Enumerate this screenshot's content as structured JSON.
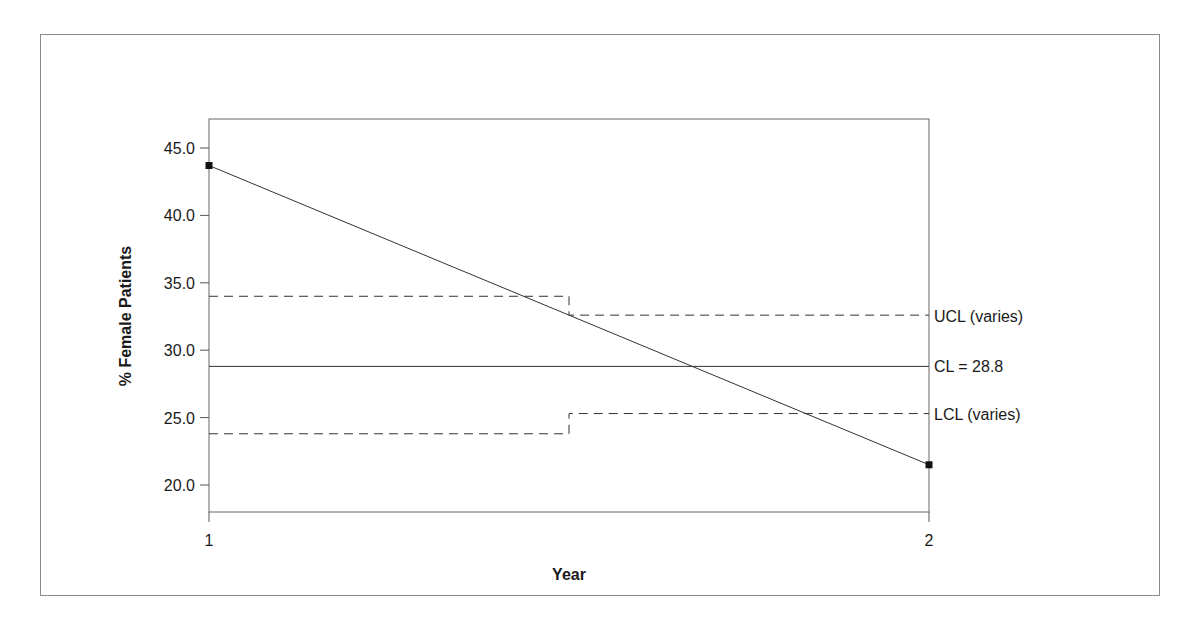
{
  "chart_data": {
    "type": "line",
    "subtype": "p-chart (control chart)",
    "title": "",
    "xlabel": "Year",
    "ylabel": "% Female Patients",
    "x": [
      1,
      2
    ],
    "x_tick_labels": [
      "1",
      "2"
    ],
    "y_ticks": [
      20.0,
      25.0,
      30.0,
      35.0,
      40.0,
      45.0
    ],
    "y_tick_labels": [
      "20.0",
      "25.0",
      "30.0",
      "35.0",
      "40.0",
      "45.0"
    ],
    "ylim": [
      18.0,
      47.2
    ],
    "xlim": [
      1,
      2
    ],
    "grid": false,
    "series": [
      {
        "name": "% Female Patients",
        "values": [
          43.7,
          21.5
        ],
        "marker": "square",
        "line": "solid"
      }
    ],
    "control_limits": {
      "cl": {
        "label": "CL = 28.8",
        "value": 28.8,
        "line": "solid"
      },
      "ucl": {
        "label": "UCL (varies)",
        "steps": [
          {
            "x_from": 1,
            "x_to": 1.5,
            "value": 34.0
          },
          {
            "x_from": 1.5,
            "x_to": 2,
            "value": 32.6
          }
        ],
        "line": "dashed"
      },
      "lcl": {
        "label": "LCL (varies)",
        "steps": [
          {
            "x_from": 1,
            "x_to": 1.5,
            "value": 23.8
          },
          {
            "x_from": 1.5,
            "x_to": 2,
            "value": 25.3
          }
        ],
        "line": "dashed"
      }
    },
    "colors": {
      "line": "#333333",
      "axis": "#555555",
      "text": "#1a1a1a"
    }
  }
}
